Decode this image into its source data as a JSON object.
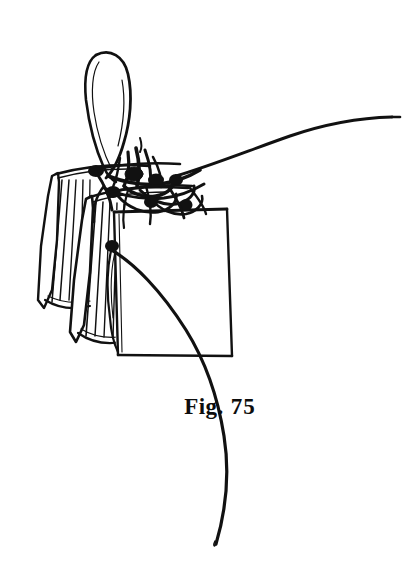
{
  "figure": {
    "caption_label": "Fig.",
    "caption_number": "75",
    "caption_full": "Fig. 75",
    "style": "black-ink-line-drawing",
    "background_color": "#ffffff",
    "ink_color": "#111111",
    "canvas": {
      "width": 415,
      "height": 571
    },
    "elements": {
      "needle_loop": "needle-eye-loop",
      "knot_cluster": "thread-knot-cluster",
      "trailing_thread": "thread-trailing-right",
      "descending_thread": "thread-descending-down",
      "front_panel": "front-section-panel",
      "middle_panel": "middle-section-panel",
      "rear_panel": "rear-section-panel",
      "pleats": "folded-pleat-gathers"
    }
  }
}
